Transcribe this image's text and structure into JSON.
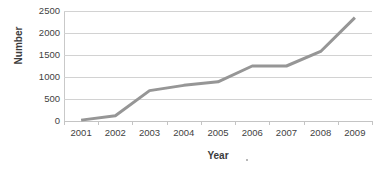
{
  "chart_data": {
    "type": "line",
    "title": "",
    "xlabel": "Year",
    "ylabel": "Number",
    "categories": [
      "2001",
      "2002",
      "2003",
      "2004",
      "2005",
      "2006",
      "2007",
      "2008",
      "2009"
    ],
    "values": [
      20,
      120,
      690,
      810,
      890,
      1250,
      1250,
      1580,
      2350
    ],
    "series": [
      {
        "name": "Number",
        "values": [
          20,
          120,
          690,
          810,
          890,
          1250,
          1250,
          1580,
          2350
        ],
        "color": "#969696"
      }
    ],
    "ylim": [
      0,
      2500
    ],
    "ytick_labels": [
      "0",
      "500",
      "1000",
      "1500",
      "2000",
      "2500"
    ],
    "ytick_values": [
      0,
      500,
      1000,
      1500,
      2000,
      2500
    ],
    "grid": true,
    "grid_axis": "y",
    "legend": false,
    "legend_position": "none",
    "line_color": "#969696",
    "gridline_color": "#d2d2d2",
    "axis_color": "#c4c4c4",
    "background": "#ffffff",
    "markers": false,
    "line_width": 3
  }
}
